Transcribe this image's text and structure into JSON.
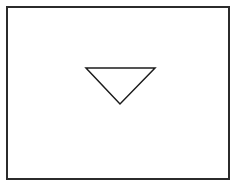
{
  "canvas": {
    "width": 237,
    "height": 187,
    "background_color": "#ffffff"
  },
  "frame": {
    "name": "outer-border-rectangle",
    "x": 6,
    "y": 6,
    "width": 224,
    "height": 174,
    "stroke_color": "#2b2b2b",
    "stroke_width": 2,
    "fill_color": "#ffffff"
  },
  "shapes": [
    {
      "name": "downward-triangle",
      "type": "triangle",
      "orientation": "down",
      "points": "86,68 155,68 120,104",
      "vertices": [
        {
          "label": "top-left",
          "x": 86,
          "y": 68
        },
        {
          "label": "top-right",
          "x": 155,
          "y": 68
        },
        {
          "label": "bottom-apex",
          "x": 120,
          "y": 104
        }
      ],
      "stroke_color": "#1c1c1c",
      "stroke_width": 1.5,
      "fill_color": "none",
      "width": 69,
      "height": 36
    }
  ],
  "labels": []
}
